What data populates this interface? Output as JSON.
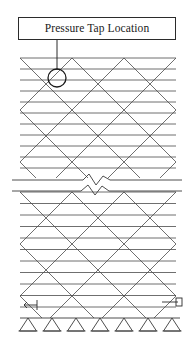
{
  "figure": {
    "name": "lattice-tower-elevation",
    "callout": {
      "label": "Pressure Tap Location",
      "box": {
        "x": 18,
        "y": 17,
        "width": 158,
        "height": 23
      },
      "leader": {
        "from_x": 57,
        "from_y": 40,
        "to_x": 57,
        "to_y": 70
      },
      "marker": {
        "type": "circle",
        "cx": 57,
        "cy": 78,
        "r": 9
      }
    },
    "structure": {
      "type": "triangulated-lattice-truss",
      "left_x": 20,
      "right_x": 176,
      "bay_width": 26,
      "bay_count": 6,
      "upper_section": {
        "top_y": 58,
        "bottom_y": 178,
        "ring_spacing": 11,
        "ring_count": 11
      },
      "lower_section": {
        "top_y": 192,
        "bottom_y": 318,
        "ring_spacing": 11.5,
        "ring_count": 11
      },
      "diagonal_pitch": 26,
      "line_color": "#4a4a4a",
      "line_width": 0.8
    },
    "break_symbol": {
      "type": "zigzag-break",
      "upper_line_y": 180,
      "lower_line_y": 191,
      "left_x": 12,
      "right_x": 182,
      "zig_center_x": 97
    },
    "supports": {
      "type": "pin-support-triangle",
      "baseline_y": 318,
      "count": 7,
      "positions_x": [
        28,
        52,
        76,
        100,
        124,
        148,
        172
      ],
      "triangle_width": 17,
      "triangle_height": 13
    },
    "dimension_markers": [
      {
        "name": "left-dimension-arrow",
        "x": 30,
        "y": 305
      },
      {
        "name": "right-dimension-arrow",
        "x": 172,
        "y": 302
      }
    ],
    "colors": {
      "ink": "#2b2b2b",
      "lattice": "#4a4a4a",
      "background": "#ffffff"
    }
  }
}
